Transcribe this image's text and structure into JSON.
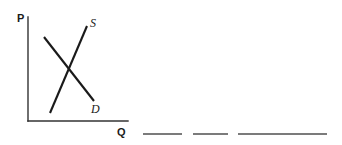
{
  "figure": {
    "type": "supply-and-demand-diagram",
    "background_color": "#ffffff",
    "ink_color": "#1a1a1a",
    "axis_color": "#333333",
    "rule_color": "#4f4f4f",
    "axes": {
      "vertical": {
        "label": "P",
        "name": "price-axis",
        "x": 28,
        "y_top": 17,
        "y_bottom": 121,
        "label_x": 17,
        "label_y": 22
      },
      "horizontal": {
        "label": "Q",
        "name": "quantity-axis",
        "y": 121,
        "x_left": 28,
        "x_right": 128,
        "label_x": 117,
        "label_y": 136
      }
    },
    "curves": [
      {
        "name": "supply-curve",
        "label": "S",
        "slope": "upward",
        "x1": 50,
        "y1": 113,
        "x2": 87,
        "y2": 26,
        "label_x": 90,
        "label_y": 27
      },
      {
        "name": "demand-curve",
        "label": "D",
        "slope": "downward",
        "x1": 44,
        "y1": 37,
        "x2": 94,
        "y2": 101,
        "label_x": 91,
        "label_y": 113
      }
    ],
    "intersection": {
      "name": "equilibrium-point",
      "x": 71,
      "y": 72
    },
    "answer_rules": [
      {
        "name": "answer-blank-1",
        "x1": 143,
        "x2": 182,
        "y": 134
      },
      {
        "name": "answer-blank-2",
        "x1": 193,
        "x2": 228,
        "y": 134
      },
      {
        "name": "answer-blank-3",
        "x1": 238,
        "x2": 327,
        "y": 134
      }
    ]
  }
}
